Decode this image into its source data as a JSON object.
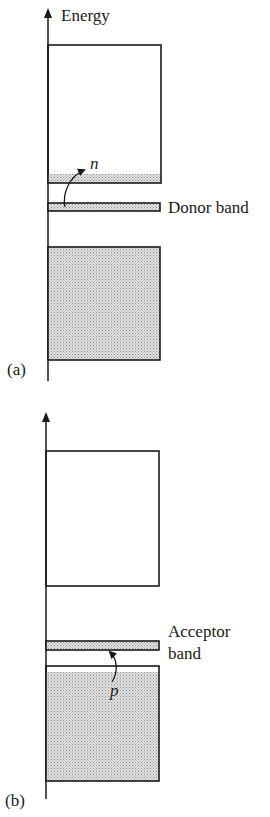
{
  "figure": {
    "panel_a": {
      "label": "(a)",
      "axis_label": "Energy",
      "carrier_label": "n",
      "impurity_band_label": "Donor band",
      "bands": [
        {
          "name": "conduction band",
          "top": 45,
          "bottom": 183,
          "fill": "partially filled at bottom"
        },
        {
          "name": "donor band",
          "top": 203,
          "bottom": 211,
          "fill": "filled"
        },
        {
          "name": "valence band",
          "top": 247,
          "bottom": 360,
          "fill": "filled"
        }
      ]
    },
    "panel_b": {
      "label": "(b)",
      "carrier_label": "p",
      "impurity_band_label_line1": "Acceptor",
      "impurity_band_label_line2": "band",
      "bands": [
        {
          "name": "conduction band",
          "top": 451,
          "bottom": 586,
          "fill": "empty"
        },
        {
          "name": "acceptor band",
          "top": 641,
          "bottom": 650,
          "fill": "filled"
        },
        {
          "name": "valence band",
          "top": 666,
          "bottom": 781,
          "fill": "filled, hole near top"
        }
      ]
    }
  },
  "colors": {
    "line": "#1a1a1a",
    "stipple": "#bdbdbd",
    "background": "#ffffff"
  }
}
